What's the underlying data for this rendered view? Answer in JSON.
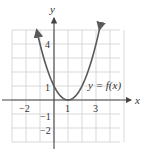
{
  "chart_data": {
    "type": "line",
    "title": "",
    "xlabel": "x",
    "ylabel": "y",
    "curve_label": "y = f(x)",
    "function": "f(x) = (x - 1)^2",
    "xlim": [
      -3,
      5
    ],
    "ylim": [
      -3,
      5
    ],
    "grid": true,
    "x_tick_labels": [
      "−2",
      "1",
      "3"
    ],
    "y_tick_labels": [
      "4",
      "1",
      "−1",
      "−2"
    ],
    "series": [
      {
        "name": "y = f(x)",
        "x": [
          -1.24,
          -1,
          0,
          1,
          2,
          3,
          3.24
        ],
        "y": [
          5,
          4,
          1,
          0,
          1,
          4,
          5
        ]
      }
    ],
    "colors": {
      "curve": "#5a5a5a",
      "axis": "#444444",
      "grid": "#d9d9d9"
    }
  }
}
